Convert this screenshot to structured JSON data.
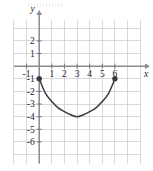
{
  "figure": {
    "title": "",
    "background_color": "#ffffff",
    "grid_color": "#c9c9cf",
    "axis_color": "#8a8a90",
    "curve_color": "#3b3b3f",
    "label_color": "#1d1d1f"
  },
  "axes": {
    "x_label": "x",
    "y_label": "y",
    "x_min": -1.5,
    "x_max": 7.2,
    "y_min": -7.2,
    "y_max": 3.3,
    "x_tick_labels": [
      "-1",
      "1",
      "2",
      "3",
      "4",
      "5",
      "6"
    ],
    "x_tick_values": [
      -1,
      1,
      2,
      3,
      4,
      5,
      6
    ],
    "y_tick_labels": [
      "2",
      "1",
      "-1",
      "-2",
      "-3",
      "-4",
      "-5",
      "-6"
    ],
    "y_tick_values": [
      2,
      1,
      -1,
      -2,
      -3,
      -4,
      -5,
      -6
    ],
    "grid": true,
    "x_arrow": true,
    "y_arrow": true
  },
  "chart_data": {
    "type": "line",
    "title": "",
    "xlabel": "x",
    "ylabel": "y",
    "xlim": [
      -1.5,
      7.2
    ],
    "ylim": [
      -7.2,
      3.3
    ],
    "grid": true,
    "legend": null,
    "series": [
      {
        "name": "arc",
        "x": [
          0,
          0.5,
          1,
          1.5,
          2,
          2.5,
          3,
          3.5,
          4,
          4.5,
          5,
          5.5,
          6
        ],
        "y": [
          -1,
          -2.15,
          -2.8,
          -3.3,
          -3.6,
          -3.85,
          -4,
          -3.85,
          -3.6,
          -3.3,
          -2.8,
          -2.15,
          -1
        ]
      }
    ],
    "points": [
      {
        "label": "left-endpoint",
        "x": 0,
        "y": -1,
        "marker": "filled-circle"
      },
      {
        "label": "right-endpoint",
        "x": 6,
        "y": -1,
        "marker": "filled-circle"
      }
    ],
    "vertex": {
      "x": 3,
      "y": -4
    }
  }
}
